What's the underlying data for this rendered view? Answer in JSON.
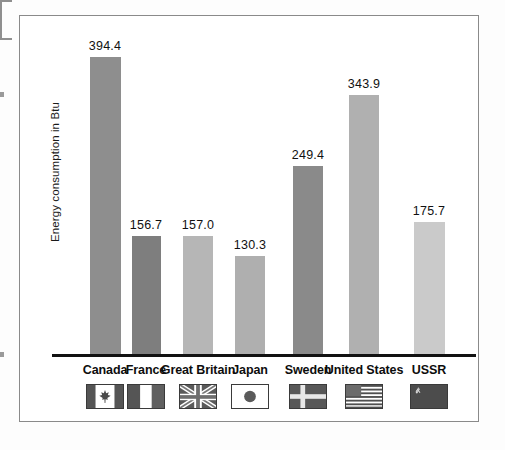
{
  "chart_data": {
    "type": "bar",
    "title": "",
    "xlabel": "",
    "ylabel": "Energy consumption in Btu",
    "ylim": [
      0,
      420
    ],
    "grid": false,
    "legend_position": "below-axis-with-flags",
    "categories": [
      "Canada",
      "France",
      "Great Britain",
      "Japan",
      "Sweden",
      "United States",
      "USSR"
    ],
    "values": [
      394.4,
      156.7,
      157.0,
      130.3,
      249.4,
      343.9,
      175.7
    ],
    "value_labels": [
      "394.4",
      "156.7",
      "157.0",
      "130.3",
      "249.4",
      "343.9",
      "175.7"
    ],
    "bar_colors": [
      "#8e8e8e",
      "#7e7e7e",
      "#b6b6b6",
      "#afafaf",
      "#8a8a8a",
      "#b0b0b0",
      "#cacaca"
    ]
  },
  "axis": {
    "y_title": "Energy consumption in Btu"
  },
  "bars": [
    {
      "label": "Canada",
      "value": 394.4,
      "value_label": "394.4",
      "color": "#8e8e8e",
      "flag": "flag-canada",
      "flag_name": "canada-flag-icon"
    },
    {
      "label": "France",
      "value": 156.7,
      "value_label": "156.7",
      "color": "#7e7e7e",
      "flag": "flag-france",
      "flag_name": "france-flag-icon"
    },
    {
      "label": "Great Britain",
      "value": 157.0,
      "value_label": "157.0",
      "color": "#b6b6b6",
      "flag": "flag-uk",
      "flag_name": "united-kingdom-flag-icon"
    },
    {
      "label": "Japan",
      "value": 130.3,
      "value_label": "130.3",
      "color": "#afafaf",
      "flag": "flag-japan",
      "flag_name": "japan-flag-icon"
    },
    {
      "label": "Sweden",
      "value": 249.4,
      "value_label": "249.4",
      "color": "#8a8a8a",
      "flag": "flag-sweden",
      "flag_name": "sweden-flag-icon"
    },
    {
      "label": "United States",
      "value": 343.9,
      "value_label": "343.9",
      "color": "#b0b0b0",
      "flag": "flag-usa",
      "flag_name": "united-states-flag-icon"
    },
    {
      "label": "USSR",
      "value": 175.7,
      "value_label": "175.7",
      "color": "#cacaca",
      "flag": "flag-ussr",
      "flag_name": "ussr-flag-icon"
    }
  ],
  "colors": {
    "frame_border": "#8a8a8a",
    "baseline": "#121212",
    "text": "#111111",
    "background": "#ffffff"
  }
}
